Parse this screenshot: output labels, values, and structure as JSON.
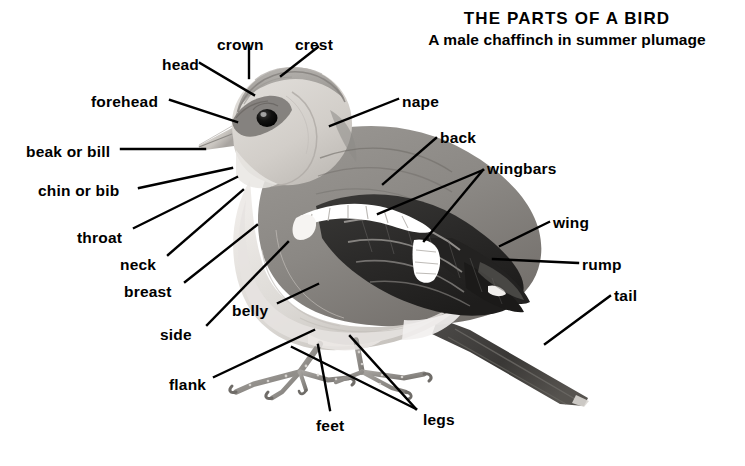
{
  "title": {
    "main": "THE PARTS OF A BIRD",
    "subtitle": "A male chaffinch in summer plumage"
  },
  "subject": {
    "common_name": "chaffinch",
    "sex": "male",
    "season": "summer plumage",
    "illustration_style": "grayscale halftone illustration"
  },
  "colors": {
    "background": "#ffffff",
    "ink": "#000000",
    "plumage_light": "#d8d5d2",
    "plumage_mid": "#9c9a97",
    "plumage_dark": "#4a4846",
    "wing_black": "#2b2a29",
    "wingbar_white": "#ffffff",
    "leg_gray": "#8a8886"
  },
  "labels": [
    {
      "id": "head",
      "text": "head",
      "x": 162,
      "y": 57,
      "anchor": "start"
    },
    {
      "id": "crown",
      "text": "crown",
      "x": 217,
      "y": 37,
      "anchor": "start"
    },
    {
      "id": "crest",
      "text": "crest",
      "x": 295,
      "y": 37,
      "anchor": "start"
    },
    {
      "id": "forehead",
      "text": "forehead",
      "x": 91,
      "y": 94,
      "anchor": "start"
    },
    {
      "id": "beak-or-bill",
      "text": "beak or bill",
      "x": 26,
      "y": 144,
      "anchor": "start"
    },
    {
      "id": "chin-or-bib",
      "text": "chin or bib",
      "x": 38,
      "y": 183,
      "anchor": "start"
    },
    {
      "id": "throat",
      "text": "throat",
      "x": 77,
      "y": 230,
      "anchor": "start"
    },
    {
      "id": "neck",
      "text": "neck",
      "x": 120,
      "y": 257,
      "anchor": "start"
    },
    {
      "id": "breast",
      "text": "breast",
      "x": 124,
      "y": 284,
      "anchor": "start"
    },
    {
      "id": "side",
      "text": "side",
      "x": 160,
      "y": 327,
      "anchor": "start"
    },
    {
      "id": "belly",
      "text": "belly",
      "x": 232,
      "y": 303,
      "anchor": "start"
    },
    {
      "id": "flank",
      "text": "flank",
      "x": 169,
      "y": 377,
      "anchor": "start"
    },
    {
      "id": "feet",
      "text": "feet",
      "x": 316,
      "y": 418,
      "anchor": "start"
    },
    {
      "id": "legs",
      "text": "legs",
      "x": 423,
      "y": 412,
      "anchor": "start"
    },
    {
      "id": "nape",
      "text": "nape",
      "x": 402,
      "y": 94,
      "anchor": "start"
    },
    {
      "id": "back",
      "text": "back",
      "x": 440,
      "y": 130,
      "anchor": "start"
    },
    {
      "id": "wingbars",
      "text": "wingbars",
      "x": 487,
      "y": 161,
      "anchor": "start"
    },
    {
      "id": "wing",
      "text": "wing",
      "x": 553,
      "y": 215,
      "anchor": "start"
    },
    {
      "id": "rump",
      "text": "rump",
      "x": 582,
      "y": 257,
      "anchor": "start"
    },
    {
      "id": "tail",
      "text": "tail",
      "x": 614,
      "y": 288,
      "anchor": "start"
    }
  ],
  "leader_lines": [
    {
      "id": "head",
      "points": "200,63 254,95"
    },
    {
      "id": "crown",
      "points": "249,46 249,78"
    },
    {
      "id": "crest",
      "points": "318,47 281,76"
    },
    {
      "id": "forehead",
      "points": "170,100 237,122"
    },
    {
      "id": "beak-or-bill",
      "points": "121,149 205,149"
    },
    {
      "id": "chin-or-bib",
      "points": "139,188 232,168"
    },
    {
      "id": "throat",
      "points": "134,228 237,177"
    },
    {
      "id": "neck",
      "points": "168,255 243,190"
    },
    {
      "id": "breast",
      "points": "185,282 257,225"
    },
    {
      "id": "side",
      "points": "207,325 288,242"
    },
    {
      "id": "belly",
      "points": "278,303 318,284"
    },
    {
      "id": "flank",
      "points": "214,377 314,330"
    },
    {
      "id": "feet",
      "points": "330,410 318,345"
    },
    {
      "id": "legs",
      "points": "416,409 350,336"
    },
    {
      "id": "legs2",
      "points": "416,409 292,347"
    },
    {
      "id": "nape",
      "points": "398,99 330,126"
    },
    {
      "id": "back",
      "points": "436,138 383,184"
    },
    {
      "id": "wingbars",
      "points": "483,170 378,214"
    },
    {
      "id": "wingbars2",
      "points": "483,170 424,241"
    },
    {
      "id": "wing",
      "points": "549,222 500,246"
    },
    {
      "id": "rump",
      "points": "578,263 493,259"
    },
    {
      "id": "tail",
      "points": "610,296 545,344"
    }
  ]
}
